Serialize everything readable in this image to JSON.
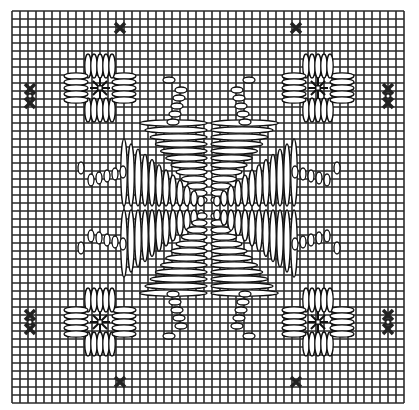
{
  "diagram": {
    "title": "",
    "kind": "needlepoint stitch chart",
    "colors": {
      "background": "#ffffff",
      "grid": "#2a2a2a",
      "stitch_fill": "#ffffff",
      "stitch_stroke": "#111111",
      "cross": "#222222"
    },
    "grid": {
      "x0": 12,
      "y0": 11,
      "cell": 8,
      "cols": 49,
      "rows": 49
    },
    "center": {
      "x": 209,
      "y": 208
    },
    "corner_flowers": [
      {
        "name": "top-left",
        "cx": 100,
        "cy": 88
      },
      {
        "name": "top-right",
        "cx": 318,
        "cy": 88
      },
      {
        "name": "bottom-left",
        "cx": 100,
        "cy": 322
      },
      {
        "name": "bottom-right",
        "cx": 318,
        "cy": 322
      }
    ],
    "single_crosses": [
      {
        "x": 120,
        "y": 28
      },
      {
        "x": 296,
        "y": 28
      },
      {
        "x": 120,
        "y": 382
      },
      {
        "x": 296,
        "y": 382
      }
    ],
    "double_crosses": [
      {
        "x": 30,
        "y": 96
      },
      {
        "x": 388,
        "y": 96
      },
      {
        "x": 30,
        "y": 322
      },
      {
        "x": 388,
        "y": 322
      }
    ]
  }
}
